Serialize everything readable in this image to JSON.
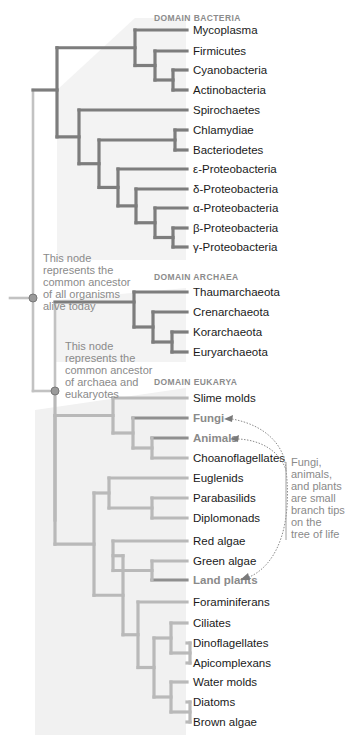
{
  "colors": {
    "bacteria_branch": "#7d7d7d",
    "archaea_branch": "#7d7d7d",
    "eukarya_branch": "#b9b9b9",
    "root_branch": "#c2c2c2",
    "highlight_branch": "#8f8f8f",
    "shade": "#f2f2f2",
    "note_text": "#8a8a8a",
    "node_fill": "#9a9a9a"
  },
  "domains": {
    "bacteria": "DOMAIN BACTERIA",
    "archaea": "DOMAIN ARCHAEA",
    "eukarya": "DOMAIN EUKARYA"
  },
  "leaves": {
    "bacteria": [
      "Mycoplasma",
      "Firmicutes",
      "Cyanobacteria",
      "Actinobacteria",
      "Spirochaetes",
      "Chlamydiae",
      "Bacteriodetes",
      "ε-Proteobacteria",
      "δ-Proteobacteria",
      "α-Proteobacteria",
      "β-Proteobacteria",
      "γ-Proteobacteria"
    ],
    "archaea": [
      "Thaumarchaeota",
      "Crenarchaeota",
      "Korarchaeota",
      "Euryarchaeota"
    ],
    "eukarya": [
      "Slime molds",
      "Fungi",
      "Animals",
      "Choanoflagellates",
      "Euglenids",
      "Parabasilids",
      "Diplomonads",
      "Red algae",
      "Green algae",
      "Land plants",
      "Foraminiferans",
      "Ciliates",
      "Dinoflagellates",
      "Apicomplexans",
      "Water molds",
      "Diatoms",
      "Brown algae"
    ]
  },
  "highlighted": [
    "Fungi",
    "Animals",
    "Land plants"
  ],
  "notes": {
    "root_node": [
      "This node",
      "represents the",
      "common ancestor",
      "of all organisms",
      "alive today"
    ],
    "archaea_eukarya_node": [
      "This node",
      "represents the",
      "common ancestor",
      "of archaea and",
      "eukaryotes"
    ],
    "callout": [
      "Fungi,",
      "animals,",
      "and plants",
      "are small",
      "branch tips",
      "on the",
      "tree of life"
    ]
  }
}
